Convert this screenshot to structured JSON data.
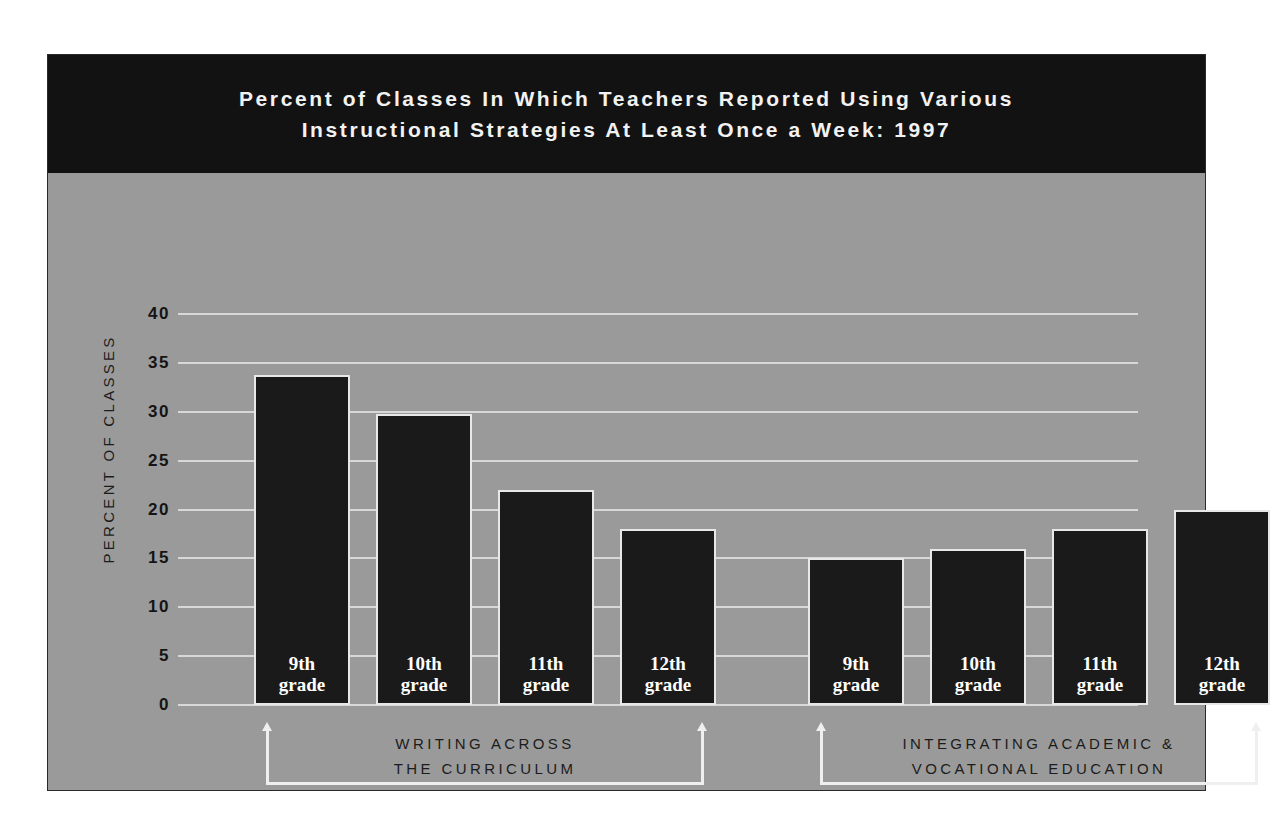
{
  "chart_data": {
    "type": "bar",
    "title": "Percent of Classes In Which Teachers Reported Using Various Instructional Strategies At Least Once a Week: 1997",
    "title_lines": [
      "Percent of Classes In Which Teachers Reported Using Various",
      "Instructional Strategies At Least Once a Week: 1997"
    ],
    "xlabel": "",
    "ylabel": "PERCENT OF CLASSES",
    "ylim": [
      0,
      40
    ],
    "ytick_labels": [
      "0",
      "5",
      "10",
      "15",
      "20",
      "25",
      "30",
      "35",
      "40"
    ],
    "ytick_values": [
      0,
      5,
      10,
      15,
      20,
      25,
      30,
      35,
      40
    ],
    "grid": true,
    "legend": "none",
    "categories": [
      "9th grade",
      "10th grade",
      "11th grade",
      "12th grade"
    ],
    "groups": [
      {
        "label": "WRITING ACROSS THE CURRICULUM",
        "label_lines": [
          "WRITING ACROSS",
          "THE CURRICULUM"
        ],
        "bars": [
          {
            "label_lines": [
              "9th",
              "grade"
            ],
            "category": "9th grade",
            "value": 33.8
          },
          {
            "label_lines": [
              "10th",
              "grade"
            ],
            "category": "10th grade",
            "value": 29.8
          },
          {
            "label_lines": [
              "11th",
              "grade"
            ],
            "category": "11th grade",
            "value": 22
          },
          {
            "label_lines": [
              "12th",
              "grade"
            ],
            "category": "12th grade",
            "value": 18
          }
        ]
      },
      {
        "label": "INTEGRATING ACADEMIC & VOCATIONAL EDUCATION",
        "label_lines": [
          "INTEGRATING ACADEMIC &",
          "VOCATIONAL EDUCATION"
        ],
        "bars": [
          {
            "label_lines": [
              "9th",
              "grade"
            ],
            "category": "9th grade",
            "value": 15
          },
          {
            "label_lines": [
              "10th",
              "grade"
            ],
            "category": "10th grade",
            "value": 16
          },
          {
            "label_lines": [
              "11th",
              "grade"
            ],
            "category": "11th grade",
            "value": 18
          },
          {
            "label_lines": [
              "12th",
              "grade"
            ],
            "category": "12th grade",
            "value": 20
          }
        ]
      }
    ],
    "series": [
      {
        "name": "WRITING ACROSS THE CURRICULUM",
        "values": [
          33.8,
          29.8,
          22,
          18
        ]
      },
      {
        "name": "INTEGRATING ACADEMIC & VOCATIONAL EDUCATION",
        "values": [
          15,
          16,
          18,
          20
        ]
      }
    ]
  },
  "colors": {
    "panel_background": "#9a9a9a",
    "title_band": "#121212",
    "title_text": "#f2f2f2",
    "bar_fill": "#1a1a1a",
    "bar_outline": "#e8e8e8",
    "gridline": "#d8d8d8",
    "axis_text": "#141414",
    "bracket": "#efefef",
    "page_background": "#ffffff"
  }
}
